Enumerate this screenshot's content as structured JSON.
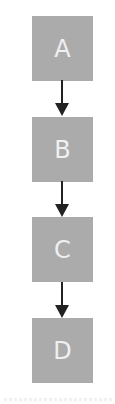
{
  "diagram": {
    "type": "flowchart",
    "direction": "top-to-bottom",
    "colors": {
      "node_fill": "#ababab",
      "node_text": "#f4f4f4",
      "edge": "#222222",
      "background": "#ffffff"
    },
    "nodes": [
      {
        "id": "A",
        "label": "A"
      },
      {
        "id": "B",
        "label": "B"
      },
      {
        "id": "C",
        "label": "C"
      },
      {
        "id": "D",
        "label": "D"
      }
    ],
    "edges": [
      {
        "from": "A",
        "to": "B"
      },
      {
        "from": "B",
        "to": "C"
      },
      {
        "from": "C",
        "to": "D"
      }
    ]
  }
}
